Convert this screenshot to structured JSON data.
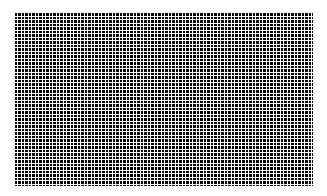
{
  "page": {
    "width": 327,
    "height": 196,
    "background_color": "#ffffff",
    "content_type": "halftone-grid-texture",
    "title": ""
  },
  "pattern": {
    "name": "square-dot-grid",
    "foreground_color": "#000000",
    "background_color": "#ffffff",
    "left": 14,
    "top": 12,
    "width": 299,
    "height": 174,
    "cell_period_px": 3.5,
    "gap_px": 1,
    "dot_size_px": 2.5,
    "columns": 85,
    "rows": 50,
    "label": ""
  },
  "chart_data": {
    "type": "heatmap",
    "title": "",
    "xlabel": "",
    "ylabel": "",
    "grid": true,
    "legend": "none",
    "columns": 85,
    "rows": 50,
    "fill_value": 1,
    "colors": [
      "#ffffff",
      "#000000"
    ]
  }
}
